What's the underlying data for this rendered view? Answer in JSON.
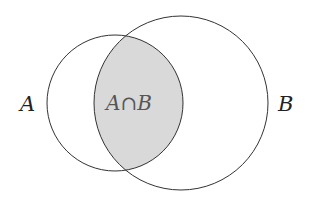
{
  "diagram": {
    "type": "venn",
    "sets": [
      {
        "id": "A",
        "label": "A",
        "cx": 115,
        "cy": 103,
        "r": 68
      },
      {
        "id": "B",
        "label": "B",
        "cx": 181,
        "cy": 103,
        "r": 87
      }
    ],
    "intersection": {
      "label": "A∩B",
      "fill": "#d9d9d9"
    },
    "colors": {
      "stroke": "#333333",
      "background": "#ffffff"
    }
  }
}
